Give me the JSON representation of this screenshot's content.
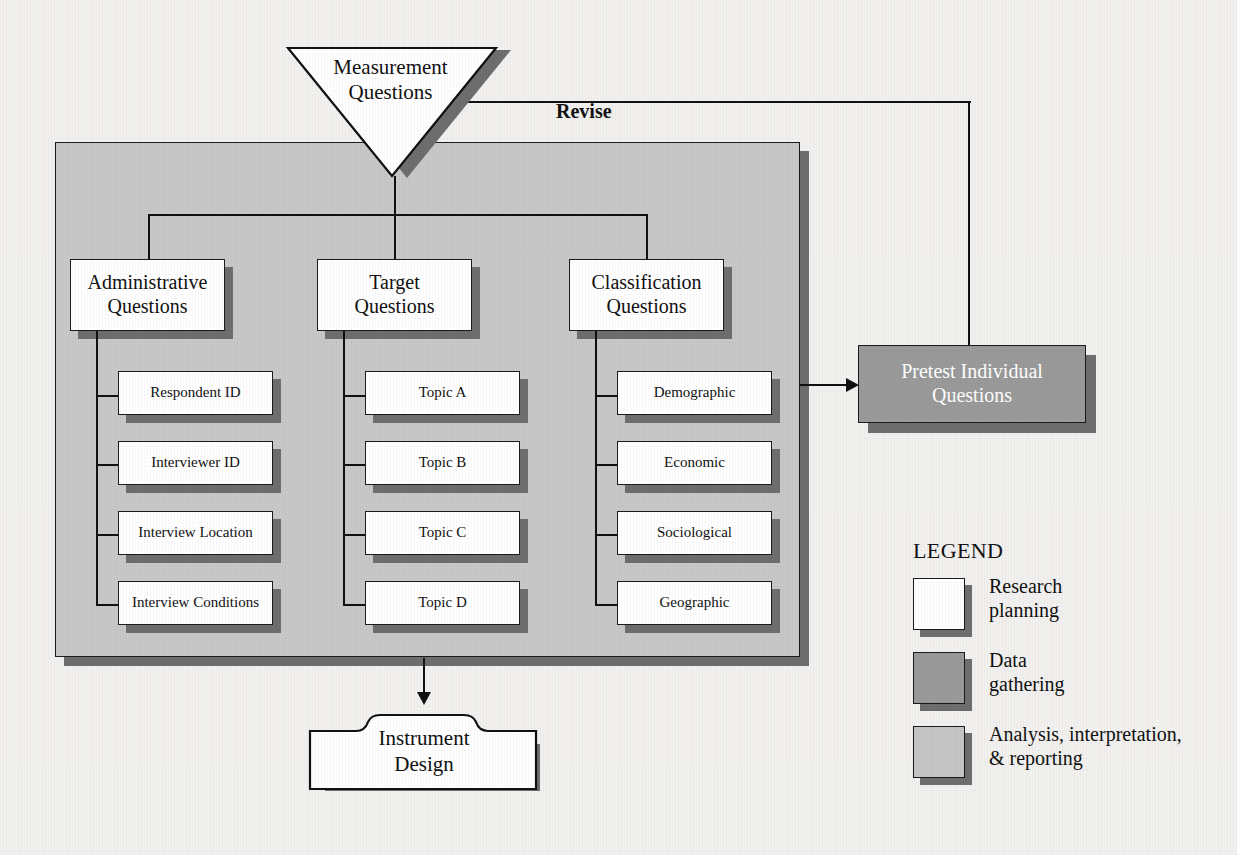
{
  "diagram": {
    "top_node": {
      "label": "Measurement\nQuestions",
      "shape": "inverted-triangle",
      "fill": "#ffffff"
    },
    "revise_label": "Revise",
    "columns": [
      {
        "header": "Administrative\nQuestions",
        "items": [
          "Respondent ID",
          "Interviewer ID",
          "Interview Location",
          "Interview Conditions"
        ]
      },
      {
        "header": "Target\nQuestions",
        "items": [
          "Topic A",
          "Topic B",
          "Topic C",
          "Topic D"
        ]
      },
      {
        "header": "Classification\nQuestions",
        "items": [
          "Demographic",
          "Economic",
          "Sociological",
          "Geographic"
        ]
      }
    ],
    "pretest_node": {
      "label": "Pretest Individual\nQuestions",
      "fill": "#9a9a9a",
      "text_color": "#ffffff"
    },
    "instrument_node": {
      "label": "Instrument\nDesign",
      "shape": "folder",
      "fill": "#ffffff"
    }
  },
  "legend": {
    "title": "LEGEND",
    "entries": [
      {
        "label": "Research\nplanning",
        "swatch": "#ffffff"
      },
      {
        "label": "Data\ngathering",
        "swatch": "#9a9a9a"
      },
      {
        "label": "Analysis, interpretation,\n& reporting",
        "swatch": "#c6c6c6"
      }
    ]
  },
  "colors": {
    "container_fill": "#c8c8c8",
    "shadow": "#6e6e6e",
    "stroke": "#111111",
    "page_bg": "#f2f1ef"
  }
}
